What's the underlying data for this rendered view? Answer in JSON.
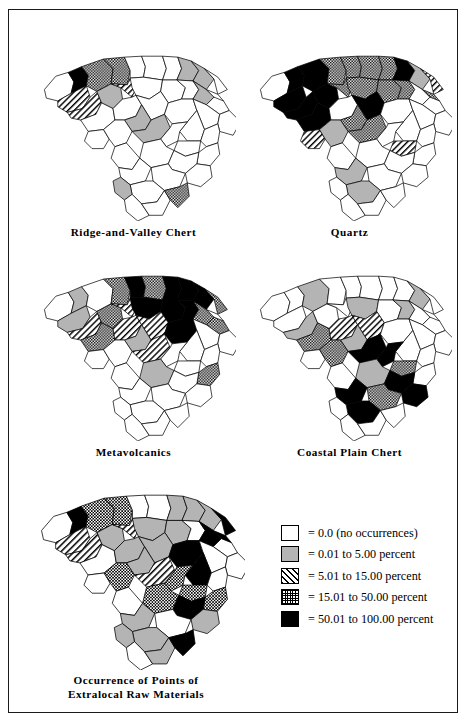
{
  "figure": {
    "title": "Occurrence of Points of Extralocal Raw Materials",
    "region": "South Carolina counties",
    "frame_color": "#1a1a1a"
  },
  "legend": {
    "name": "raw-material-percentage-legend",
    "items": [
      {
        "key": "none",
        "swatch": "white-empty",
        "label": "= 0.0 (no occurrences)",
        "range": [
          0.0,
          0.0
        ],
        "color": "#ffffff"
      },
      {
        "key": "low",
        "swatch": "solid-gray",
        "label": "= 0.01 to 5.00 percent",
        "range": [
          0.01,
          5.0
        ],
        "color": "#b4b4b4"
      },
      {
        "key": "moderate",
        "swatch": "diagonal-hatch",
        "label": "= 5.01 to 15.00 percent",
        "range": [
          5.01,
          15.0
        ],
        "color": "#000000"
      },
      {
        "key": "high",
        "swatch": "checker-hatch",
        "label": "= 15.01 to 50.00 percent",
        "range": [
          15.01,
          50.0
        ],
        "color": "#000000"
      },
      {
        "key": "very-high",
        "swatch": "solid-black",
        "label": "= 50.01 to 100.00 percent",
        "range": [
          50.01,
          100.0
        ],
        "color": "#000000"
      }
    ]
  },
  "maps": [
    {
      "id": "ridge-and-valley-chert",
      "caption": "Ridge-and-Valley Chert",
      "classes": [
        "none",
        "very-high",
        "high",
        "high",
        "none",
        "none",
        "none",
        "low",
        "low",
        "none",
        "moderate",
        "moderate",
        "low",
        "moderate",
        "none",
        "none",
        "none",
        "low",
        "none",
        "none",
        "none",
        "none",
        "none",
        "low",
        "none",
        "none",
        "none",
        "none",
        "none",
        "none",
        "none",
        "low",
        "none",
        "none",
        "none",
        "none",
        "none",
        "none",
        "none",
        "none",
        "none",
        "none",
        "low",
        "none",
        "none",
        "high"
      ]
    },
    {
      "id": "quartz",
      "caption": "Quartz",
      "classes": [
        "none",
        "very-high",
        "very-high",
        "high",
        "high",
        "high",
        "high",
        "very-high",
        "low",
        "moderate",
        "very-high",
        "very-high",
        "very-high",
        "high",
        "high",
        "high",
        "high",
        "none",
        "high",
        "none",
        "very-high",
        "none",
        "very-high",
        "high",
        "none",
        "none",
        "none",
        "none",
        "none",
        "moderate",
        "low",
        "high",
        "none",
        "moderate",
        "none",
        "none",
        "none",
        "none",
        "none",
        "none",
        "low",
        "low",
        "none",
        "none",
        "none",
        "none"
      ]
    },
    {
      "id": "metavolcanics",
      "caption": "Metavolcanics",
      "classes": [
        "none",
        "low",
        "none",
        "high",
        "very-high",
        "high",
        "very-high",
        "very-high",
        "very-high",
        "high",
        "low",
        "moderate",
        "high",
        "moderate",
        "very-high",
        "very-high",
        "very-high",
        "high",
        "none",
        "high",
        "high",
        "moderate",
        "moderate",
        "low",
        "very-high",
        "none",
        "none",
        "none",
        "none",
        "none",
        "none",
        "moderate",
        "none",
        "none",
        "low",
        "high",
        "none",
        "none",
        "none",
        "none",
        "none",
        "none",
        "none",
        "none",
        "none",
        "none"
      ]
    },
    {
      "id": "coastal-plain-chert",
      "caption": "Coastal Plain Chert",
      "classes": [
        "none",
        "none",
        "low",
        "none",
        "none",
        "none",
        "none",
        "none",
        "low",
        "none",
        "none",
        "low",
        "none",
        "none",
        "low",
        "none",
        "low",
        "none",
        "none",
        "none",
        "high",
        "moderate",
        "moderate",
        "low",
        "none",
        "none",
        "none",
        "none",
        "none",
        "none",
        "high",
        "very-high",
        "very-high",
        "high",
        "low",
        "none",
        "very-high",
        "very-high",
        "high",
        "none",
        "very-high",
        "very-high",
        "none",
        "none",
        "none",
        "none"
      ]
    },
    {
      "id": "occurrence-of-points-of-extralocal-raw-materials",
      "caption": "Occurrence of Points of\nExtralocal Raw Materials",
      "classes": [
        "none",
        "very-high",
        "high",
        "high",
        "none",
        "none",
        "low",
        "low",
        "low",
        "very-high",
        "moderate",
        "moderate",
        "low",
        "moderate",
        "low",
        "low",
        "none",
        "very-high",
        "very-high",
        "none",
        "none",
        "low",
        "low",
        "low",
        "very-high",
        "none",
        "none",
        "very-high",
        "none",
        "none",
        "high",
        "moderate",
        "high",
        "high",
        "high",
        "high",
        "very-high",
        "low",
        "none",
        "none",
        "low",
        "low",
        "low",
        "none",
        "low",
        "very-high"
      ]
    }
  ],
  "counties": [
    "Oconee",
    "Pickens",
    "Greenville",
    "Spartanburg",
    "Cherokee",
    "York",
    "Chester",
    "Lancaster",
    "Chesterfield",
    "Marlboro",
    "Anderson",
    "Abbeville",
    "Laurens",
    "Union",
    "Fairfield",
    "Kershaw",
    "Lee",
    "Darlington",
    "Dillon",
    "Marion",
    "Greenwood",
    "Newberry",
    "Richland",
    "Saluda",
    "Sumter",
    "Florence",
    "Horry",
    "Williamsburg",
    "Georgetown",
    "McCormick",
    "Edgefield",
    "Lexington",
    "Calhoun",
    "Clarendon",
    "Orangeburg",
    "Berkeley",
    "Dorchester",
    "Charleston",
    "Colleton",
    "Aiken",
    "Barnwell",
    "Bamberg",
    "Allendale",
    "Hampton",
    "Jasper",
    "Beaufort"
  ]
}
